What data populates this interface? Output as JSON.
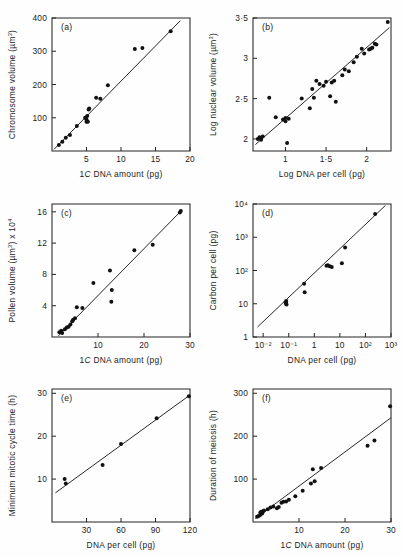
{
  "figure": {
    "title": "",
    "panel_count": 6,
    "point_color": "#111111",
    "line_color": "#1c1c1c",
    "axis_color": "#242424",
    "background": "#fefefe"
  },
  "chart_data": [
    {
      "type": "scatter",
      "panel": "(a)",
      "title": "",
      "xlabel": "1C DNA amount (pg)",
      "ylabel": "Chromosome volume (µm³)",
      "xlabel_parts": {
        "pre": "1",
        "ital": "C",
        "post": " DNA amount (pg)"
      },
      "ylabel_parts": {
        "pre": "Chromosome volume (",
        "mu": "µm",
        "sup": "3",
        "post": ")"
      },
      "xlim": [
        0,
        20
      ],
      "ylim": [
        0,
        400
      ],
      "xticks": [
        5,
        10,
        15,
        20
      ],
      "xticklabels": [
        "5",
        "10",
        "15",
        "20"
      ],
      "yticks": [
        100,
        200,
        300,
        400
      ],
      "yticklabels": [
        "100",
        "200",
        "300",
        "400"
      ],
      "grid": false,
      "legend": "none",
      "points": [
        [
          1.0,
          18
        ],
        [
          1.5,
          28
        ],
        [
          2.0,
          40
        ],
        [
          2.6,
          48
        ],
        [
          3.6,
          75
        ],
        [
          4.8,
          100
        ],
        [
          5.0,
          95
        ],
        [
          5.0,
          88
        ],
        [
          5.1,
          105
        ],
        [
          5.2,
          88
        ],
        [
          5.3,
          125
        ],
        [
          5.4,
          128
        ],
        [
          6.4,
          160
        ],
        [
          7.0,
          157
        ],
        [
          8.1,
          198
        ],
        [
          12.0,
          307
        ],
        [
          13.1,
          310
        ],
        [
          17.2,
          360
        ]
      ],
      "fit_line": {
        "x": [
          0.3,
          18.6
        ],
        "y": [
          5,
          392
        ]
      }
    },
    {
      "type": "scatter",
      "panel": "(b)",
      "title": "",
      "xlabel": "Log DNA per cell (pg)",
      "ylabel": "Log nuclear volume (µm³)",
      "ylabel_parts": {
        "pre": "Log nuclear volume (",
        "mu": "µm",
        "sup": "3",
        "post": ")"
      },
      "xlim": [
        0.6,
        2.3
      ],
      "ylim": [
        1.85,
        3.5
      ],
      "xticks": [
        1.0,
        1.5,
        2.0
      ],
      "xticklabels": [
        "1",
        "1·5",
        "2"
      ],
      "yticks": [
        2.0,
        2.5,
        3.0,
        3.5
      ],
      "yticklabels": [
        "2",
        "2·5",
        "3",
        "3·5"
      ],
      "grid": false,
      "legend": "none",
      "points": [
        [
          0.66,
          2.0
        ],
        [
          0.68,
          2.02
        ],
        [
          0.7,
          1.99
        ],
        [
          0.72,
          2.03
        ],
        [
          0.8,
          2.51
        ],
        [
          0.88,
          2.27
        ],
        [
          0.97,
          2.24
        ],
        [
          1.0,
          2.26
        ],
        [
          1.0,
          2.22
        ],
        [
          1.02,
          1.95
        ],
        [
          1.04,
          2.25
        ],
        [
          1.2,
          2.5
        ],
        [
          1.3,
          2.38
        ],
        [
          1.33,
          2.62
        ],
        [
          1.35,
          2.51
        ],
        [
          1.38,
          2.72
        ],
        [
          1.42,
          2.68
        ],
        [
          1.47,
          2.66
        ],
        [
          1.5,
          2.71
        ],
        [
          1.55,
          2.53
        ],
        [
          1.57,
          2.7
        ],
        [
          1.6,
          2.72
        ],
        [
          1.62,
          2.46
        ],
        [
          1.7,
          2.79
        ],
        [
          1.73,
          2.86
        ],
        [
          1.78,
          2.84
        ],
        [
          1.84,
          2.95
        ],
        [
          1.88,
          3.02
        ],
        [
          1.94,
          3.12
        ],
        [
          1.97,
          3.06
        ],
        [
          2.03,
          3.11
        ],
        [
          2.05,
          3.12
        ],
        [
          2.07,
          3.13
        ],
        [
          2.1,
          3.18
        ],
        [
          2.12,
          3.17
        ],
        [
          2.26,
          3.45
        ]
      ],
      "fit_line": {
        "x": [
          0.63,
          2.28
        ],
        "y": [
          1.93,
          3.38
        ]
      }
    },
    {
      "type": "scatter",
      "panel": "(c)",
      "title": "",
      "xlabel": "1C DNA amount (pg)",
      "ylabel": "Pollen volume (µm³) x 10⁴",
      "xlabel_parts": {
        "pre": "1",
        "ital": "C",
        "post": " DNA amount (pg)"
      },
      "ylabel_parts": {
        "pre": "Pollen volume (",
        "mu": "µm",
        "sup": "3",
        "mid": ") x 10",
        "sup2": "4"
      },
      "xlim": [
        0,
        30
      ],
      "ylim": [
        0,
        17
      ],
      "xticks": [
        10,
        20,
        30
      ],
      "xticklabels": [
        "10",
        "20",
        "30"
      ],
      "yticks": [
        4,
        8,
        12,
        16
      ],
      "yticklabels": [
        "4",
        "8",
        "12",
        "16"
      ],
      "grid": false,
      "legend": "none",
      "points": [
        [
          1.6,
          0.6
        ],
        [
          2.0,
          0.8
        ],
        [
          2.2,
          0.5
        ],
        [
          2.8,
          1.0
        ],
        [
          3.2,
          1.2
        ],
        [
          3.6,
          1.3
        ],
        [
          4.0,
          1.6
        ],
        [
          4.4,
          2.0
        ],
        [
          4.6,
          2.2
        ],
        [
          5.0,
          2.4
        ],
        [
          5.4,
          3.8
        ],
        [
          6.6,
          3.7
        ],
        [
          9.0,
          6.9
        ],
        [
          12.6,
          8.5
        ],
        [
          12.9,
          4.5
        ],
        [
          13.0,
          6.0
        ],
        [
          17.9,
          11.1
        ],
        [
          21.9,
          11.8
        ],
        [
          27.8,
          15.9
        ],
        [
          28.0,
          16.1
        ]
      ],
      "fit_line": {
        "x": [
          1.4,
          28.2
        ],
        "y": [
          0.15,
          16.2
        ]
      }
    },
    {
      "type": "scatter",
      "panel": "(d)",
      "title": "",
      "xlabel": "DNA per cell (pg)",
      "ylabel": "Carbon per cell (pg)",
      "xscale": "log",
      "yscale": "log",
      "xlim": [
        0.004,
        1000
      ],
      "ylim": [
        1,
        10000
      ],
      "xticks": [
        0.01,
        0.1,
        1,
        10,
        100,
        1000
      ],
      "xticklabels": [
        "10⁻²",
        "10⁻¹",
        "1",
        "10",
        "10²",
        "10³"
      ],
      "yticks": [
        1,
        10,
        100,
        1000,
        10000
      ],
      "yticklabels": [
        "1",
        "10",
        "10²",
        "10³",
        "10⁴"
      ],
      "grid": false,
      "legend": "none",
      "points": [
        [
          0.075,
          11
        ],
        [
          0.078,
          10
        ],
        [
          0.08,
          12
        ],
        [
          0.082,
          9.5
        ],
        [
          0.4,
          40
        ],
        [
          0.42,
          22
        ],
        [
          3.0,
          140
        ],
        [
          3.4,
          145
        ],
        [
          4.0,
          135
        ],
        [
          4.8,
          128
        ],
        [
          12.0,
          165
        ],
        [
          16.0,
          490
        ],
        [
          240,
          5000
        ]
      ],
      "fit_line": {
        "x": [
          0.006,
          600
        ],
        "y": [
          2.0,
          9000
        ]
      }
    },
    {
      "type": "scatter",
      "panel": "(e)",
      "title": "",
      "xlabel": "DNA per cell (pg)",
      "ylabel": "Minimum mitotic cycle time (h)",
      "xlim": [
        0,
        120
      ],
      "ylim": [
        0,
        31
      ],
      "xticks": [
        30,
        60,
        90,
        120
      ],
      "xticklabels": [
        "30",
        "60",
        "90",
        "120"
      ],
      "yticks": [
        10,
        20,
        30
      ],
      "yticklabels": [
        "10",
        "20",
        "30"
      ],
      "grid": false,
      "legend": "none",
      "points": [
        [
          11,
          10.0
        ],
        [
          12,
          9.0
        ],
        [
          44,
          13.3
        ],
        [
          60,
          18.2
        ],
        [
          91,
          24.2
        ],
        [
          119,
          29.3
        ]
      ],
      "fit_line": {
        "x": [
          3,
          120
        ],
        "y": [
          6.8,
          29.6
        ]
      }
    },
    {
      "type": "scatter",
      "panel": "(f)",
      "title": "",
      "xlabel": "1C DNA amount (pg)",
      "ylabel": "Duration of meiosis (h)",
      "xlabel_parts": {
        "pre": "1",
        "ital": "C",
        "post": " DNA amount (pg)"
      },
      "xlim": [
        0,
        30
      ],
      "ylim": [
        0,
        310
      ],
      "xticks": [
        10,
        20,
        30
      ],
      "xticklabels": [
        "10",
        "20",
        "30"
      ],
      "yticks": [
        100,
        200,
        300
      ],
      "yticklabels": [
        "100",
        "200",
        "300"
      ],
      "grid": false,
      "legend": "none",
      "points": [
        [
          0.9,
          12
        ],
        [
          1.2,
          14
        ],
        [
          1.5,
          16
        ],
        [
          1.6,
          22
        ],
        [
          1.8,
          24
        ],
        [
          2.0,
          20
        ],
        [
          2.2,
          25
        ],
        [
          2.4,
          27
        ],
        [
          3.2,
          30
        ],
        [
          3.8,
          34
        ],
        [
          4.4,
          36
        ],
        [
          5.2,
          32
        ],
        [
          5.6,
          35
        ],
        [
          6.2,
          45
        ],
        [
          6.6,
          47
        ],
        [
          7.2,
          48
        ],
        [
          7.8,
          52
        ],
        [
          9.2,
          60
        ],
        [
          10.8,
          73
        ],
        [
          12.6,
          90
        ],
        [
          13.0,
          123
        ],
        [
          13.4,
          95
        ],
        [
          14.8,
          126
        ],
        [
          24.9,
          178
        ],
        [
          26.4,
          190
        ],
        [
          29.8,
          270
        ]
      ],
      "fit_line": {
        "x": [
          0.5,
          30.0
        ],
        "y": [
          8,
          243
        ]
      }
    }
  ]
}
